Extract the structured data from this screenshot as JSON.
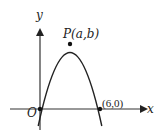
{
  "diagram": {
    "type": "coordinate-graph",
    "axes": {
      "x_label": "x",
      "y_label": "y",
      "origin_label": "O"
    },
    "curve": {
      "kind": "downward parabola",
      "passes_through": [
        "O",
        "(6,0)"
      ]
    },
    "points": [
      {
        "name": "origin",
        "label": "O"
      },
      {
        "name": "vertex",
        "label_letter": "P",
        "label_args": "(a,b)"
      },
      {
        "name": "x-intercept",
        "label": "(6,0)"
      }
    ],
    "colors": {
      "stroke": "#222222",
      "background": "#ffffff"
    }
  }
}
